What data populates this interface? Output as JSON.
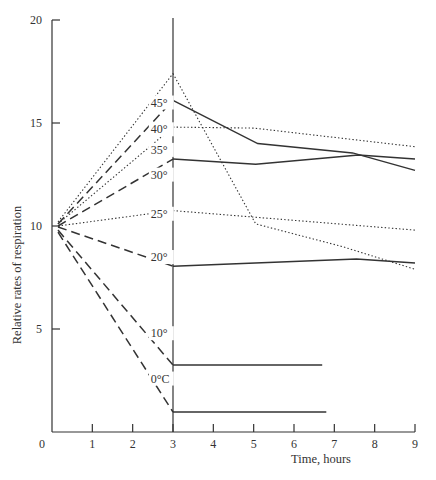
{
  "chart_data": {
    "type": "line",
    "title": "",
    "xlabel": "Time, hours",
    "ylabel": "Relative rates of respiration",
    "xlim": [
      0,
      9
    ],
    "ylim": [
      0,
      20
    ],
    "x_ticks": [
      0,
      1,
      2,
      3,
      4,
      5,
      6,
      7,
      8,
      9
    ],
    "y_ticks": [
      0,
      5,
      10,
      15,
      20
    ],
    "grid": false,
    "legend": "inline labels near x=3",
    "annotations": [
      "Vertical reference line at 3 hours (temperature change point)"
    ],
    "series": [
      {
        "name": "45°",
        "label": "45°",
        "points_before": [
          [
            0.15,
            10.2
          ],
          [
            3,
            17.4
          ]
        ],
        "style_before": "dotted",
        "points_after": [
          [
            3,
            17.4
          ],
          [
            5.05,
            10.1
          ],
          [
            7.2,
            9.0
          ],
          [
            9,
            7.9
          ]
        ],
        "style_after": "dotted",
        "label_pos": [
          2.45,
          15.8
        ]
      },
      {
        "name": "40°",
        "label": "40°",
        "points_before": [
          [
            0.15,
            10.1
          ],
          [
            3,
            16.1
          ]
        ],
        "style_before": "dashed",
        "points_after": [
          [
            3,
            16.1
          ],
          [
            5.1,
            14.0
          ],
          [
            7.45,
            13.55
          ],
          [
            9,
            12.7
          ]
        ],
        "style_after": "solid",
        "label_pos": [
          2.45,
          14.5
        ]
      },
      {
        "name": "35°",
        "label": "35°",
        "points_before": [
          [
            0.15,
            10.1
          ],
          [
            3,
            14.8
          ]
        ],
        "style_before": "dotted",
        "points_after": [
          [
            3,
            14.8
          ],
          [
            5.0,
            14.75
          ],
          [
            9,
            13.85
          ]
        ],
        "style_after": "dotted",
        "label_pos": [
          2.45,
          13.5
        ]
      },
      {
        "name": "30°",
        "label": "30°",
        "points_before": [
          [
            0.15,
            10.0
          ],
          [
            3,
            13.25
          ]
        ],
        "style_before": "dashed",
        "points_after": [
          [
            3,
            13.25
          ],
          [
            5.05,
            13.0
          ],
          [
            7.6,
            13.45
          ],
          [
            9,
            13.25
          ]
        ],
        "style_after": "solid",
        "label_pos": [
          2.45,
          12.3
        ]
      },
      {
        "name": "25°",
        "label": "25°",
        "points_before": [
          [
            0.15,
            10.0
          ],
          [
            3,
            10.75
          ]
        ],
        "style_before": "dotted",
        "points_after": [
          [
            3,
            10.75
          ],
          [
            9,
            9.8
          ]
        ],
        "style_after": "dotted",
        "label_pos": [
          2.45,
          10.4
        ]
      },
      {
        "name": "20°",
        "label": "20°",
        "points_before": [
          [
            0.15,
            9.95
          ],
          [
            3,
            8.05
          ]
        ],
        "style_before": "dashed",
        "points_after": [
          [
            3,
            8.05
          ],
          [
            7.55,
            8.4
          ],
          [
            9,
            8.2
          ]
        ],
        "style_after": "solid",
        "label_pos": [
          2.45,
          8.3
        ]
      },
      {
        "name": "10°",
        "label": "10°",
        "points_before": [
          [
            0.15,
            9.8
          ],
          [
            3,
            3.25
          ]
        ],
        "style_before": "dashed",
        "points_after": [
          [
            3,
            3.25
          ],
          [
            6.7,
            3.25
          ]
        ],
        "style_after": "solid",
        "label_pos": [
          2.45,
          4.6
        ]
      },
      {
        "name": "0°C",
        "label": "0°C",
        "points_before": [
          [
            0.15,
            9.7
          ],
          [
            3,
            0.97
          ]
        ],
        "style_before": "dashed",
        "points_after": [
          [
            3,
            0.97
          ],
          [
            6.8,
            0.97
          ]
        ],
        "style_after": "solid",
        "label_pos": [
          2.45,
          2.4
        ]
      }
    ]
  },
  "axes": {
    "x_title": "Time, hours",
    "y_title": "Relative rates of respiration",
    "x_tick_labels": [
      "0",
      "1",
      "2",
      "3",
      "4",
      "5",
      "6",
      "7",
      "8",
      "9"
    ],
    "y_tick_labels": [
      "20",
      "15",
      "10",
      "5"
    ]
  }
}
